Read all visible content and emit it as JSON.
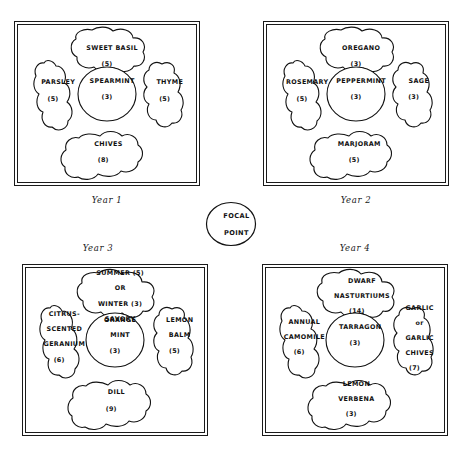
{
  "diagram": {
    "focal_point": {
      "line1": "FOCAL",
      "line2": "POINT",
      "name": "focal-point"
    },
    "plots": [
      {
        "id": "year-1",
        "caption": "Year 1",
        "caption_position": "below",
        "beds": [
          {
            "position": "top",
            "name": "sweet-basil",
            "lines": [
              "SWEET BASIL"
            ],
            "count": "(5)"
          },
          {
            "position": "left",
            "name": "parsley",
            "lines": [
              "PARSLEY"
            ],
            "count": "(5)"
          },
          {
            "position": "center",
            "name": "spearmint",
            "lines": [
              "SPEARMINT"
            ],
            "count": "(3)"
          },
          {
            "position": "right",
            "name": "thyme",
            "lines": [
              "THYME"
            ],
            "count": "(5)"
          },
          {
            "position": "bottom",
            "name": "chives",
            "lines": [
              "CHIVES"
            ],
            "count": "(8)"
          }
        ]
      },
      {
        "id": "year-2",
        "caption": "Year 2",
        "caption_position": "below",
        "beds": [
          {
            "position": "top",
            "name": "oregano",
            "lines": [
              "OREGANO"
            ],
            "count": "(3)"
          },
          {
            "position": "left",
            "name": "rosemary",
            "lines": [
              "ROSEMARY"
            ],
            "count": "(5)"
          },
          {
            "position": "center",
            "name": "peppermint",
            "lines": [
              "PEPPERMINT"
            ],
            "count": "(3)"
          },
          {
            "position": "right",
            "name": "sage",
            "lines": [
              "SAGE"
            ],
            "count": "(3)"
          },
          {
            "position": "bottom",
            "name": "marjoram",
            "lines": [
              "MARJORAM"
            ],
            "count": "(5)"
          }
        ]
      },
      {
        "id": "year-3",
        "caption": "Year 3",
        "caption_position": "above",
        "beds": [
          {
            "position": "top",
            "name": "summer-or-winter-savory",
            "lines": [
              "SUMMER (5)",
              "OR",
              "WINTER (3)",
              "SAVORY"
            ],
            "count": ""
          },
          {
            "position": "left",
            "name": "citrus-scented-geranium",
            "lines": [
              "CITRUS-",
              "SCENTED",
              "GERANIUM"
            ],
            "count": "(6)"
          },
          {
            "position": "center",
            "name": "orange-mint",
            "lines": [
              "ORANGE",
              "MINT"
            ],
            "count": "(3)"
          },
          {
            "position": "right",
            "name": "lemon-balm",
            "lines": [
              "LEMON",
              "BALM"
            ],
            "count": "(5)"
          },
          {
            "position": "bottom",
            "name": "dill",
            "lines": [
              "DILL"
            ],
            "count": "(9)"
          }
        ]
      },
      {
        "id": "year-4",
        "caption": "Year 4",
        "caption_position": "above",
        "beds": [
          {
            "position": "top",
            "name": "dwarf-nasturtiums",
            "lines": [
              "DWARF",
              "NASTURTIUMS"
            ],
            "count": "(14)"
          },
          {
            "position": "left",
            "name": "annual-camomile",
            "lines": [
              "ANNUAL",
              "CAMOMILE"
            ],
            "count": "(6)"
          },
          {
            "position": "center",
            "name": "tarragon",
            "lines": [
              "TARRAGON"
            ],
            "count": "(3)"
          },
          {
            "position": "right",
            "name": "garlic-or-garlic-chives",
            "lines": [
              "GARLIC",
              "or",
              "GARLIC",
              "CHIVES"
            ],
            "count": "(7)"
          },
          {
            "position": "bottom",
            "name": "lemon-verbena",
            "lines": [
              "LEMON",
              "VERBENA"
            ],
            "count": "(3)"
          }
        ]
      }
    ]
  }
}
